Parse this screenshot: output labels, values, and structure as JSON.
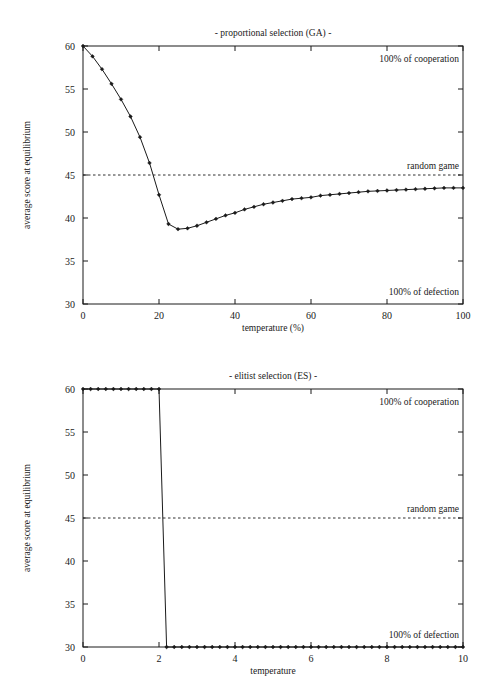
{
  "chart_data": [
    {
      "id": "proportional-selection-ga",
      "type": "line",
      "title": "- proportional selection (GA) -",
      "xlabel": "temperature (%)",
      "ylabel": "average score at equilibrium",
      "xlim": [
        0,
        100
      ],
      "ylim": [
        30,
        60
      ],
      "xticks": [
        0,
        20,
        40,
        60,
        80,
        100
      ],
      "xticklabels": [
        "0",
        "20",
        "40",
        "60",
        "80",
        "100"
      ],
      "yticks": [
        30,
        35,
        40,
        45,
        50,
        55,
        60
      ],
      "yticklabels": [
        "30",
        "35",
        "40",
        "45",
        "50",
        "55",
        "60"
      ],
      "grid": false,
      "legend": "none",
      "annotations": [
        {
          "text": "100% of cooperation",
          "x": 100,
          "y": 58.6,
          "align": "right"
        },
        {
          "text": "random game",
          "x": 100,
          "y": 46.1,
          "align": "right"
        },
        {
          "text": "100% of defection",
          "x": 100,
          "y": 31.4,
          "align": "right"
        }
      ],
      "reference_lines": [
        {
          "name": "random game",
          "axis": "y",
          "value": 45,
          "style": "dashed"
        }
      ],
      "x": [
        0,
        2.5,
        5,
        7.5,
        10,
        12.5,
        15,
        17.5,
        20,
        22.5,
        25,
        27.5,
        30,
        32.5,
        35,
        37.5,
        40,
        42.5,
        45,
        47.5,
        50,
        52.5,
        55,
        57.5,
        60,
        62.5,
        65,
        67.5,
        70,
        72.5,
        75,
        77.5,
        80,
        82.5,
        85,
        87.5,
        90,
        92.5,
        95,
        97.5,
        100
      ],
      "values": [
        60.0,
        58.8,
        57.3,
        55.6,
        53.8,
        51.8,
        49.4,
        46.4,
        42.7,
        39.3,
        38.7,
        38.8,
        39.1,
        39.5,
        39.9,
        40.3,
        40.6,
        41.0,
        41.3,
        41.6,
        41.8,
        42.0,
        42.2,
        42.3,
        42.4,
        42.6,
        42.7,
        42.8,
        42.9,
        43.0,
        43.1,
        43.15,
        43.2,
        43.25,
        43.3,
        43.35,
        43.4,
        43.45,
        43.5,
        43.5,
        43.5
      ]
    },
    {
      "id": "elitist-selection-es",
      "type": "line",
      "title": "- elitist selection (ES) -",
      "xlabel": "temperature",
      "ylabel": "average score at equilibrium",
      "xlim": [
        0,
        10
      ],
      "ylim": [
        30,
        60
      ],
      "xticks": [
        0,
        2,
        4,
        6,
        8,
        10
      ],
      "xticklabels": [
        "0",
        "2",
        "4",
        "6",
        "8",
        "10"
      ],
      "yticks": [
        30,
        35,
        40,
        45,
        50,
        55,
        60
      ],
      "yticklabels": [
        "30",
        "35",
        "40",
        "45",
        "50",
        "55",
        "60"
      ],
      "grid": false,
      "legend": "none",
      "annotations": [
        {
          "text": "100% of cooperation",
          "x": 10,
          "y": 58.6,
          "align": "right"
        },
        {
          "text": "random game",
          "x": 10,
          "y": 46.1,
          "align": "right"
        },
        {
          "text": "100% of defection",
          "x": 10,
          "y": 31.4,
          "align": "right"
        }
      ],
      "reference_lines": [
        {
          "name": "random game",
          "axis": "y",
          "value": 45,
          "style": "dashed"
        }
      ],
      "x": [
        0,
        0.2,
        0.4,
        0.6,
        0.8,
        1.0,
        1.2,
        1.4,
        1.6,
        1.8,
        2.0,
        2.2,
        2.4,
        2.6,
        2.8,
        3.0,
        3.2,
        3.4,
        3.6,
        3.8,
        4.0,
        4.2,
        4.4,
        4.6,
        4.8,
        5.0,
        5.2,
        5.4,
        5.6,
        5.8,
        6.0,
        6.2,
        6.4,
        6.6,
        6.8,
        7.0,
        7.2,
        7.4,
        7.6,
        7.8,
        8.0,
        8.2,
        8.4,
        8.6,
        8.8,
        9.0,
        9.2,
        9.4,
        9.6,
        9.8,
        10.0
      ],
      "values": [
        60,
        60,
        60,
        60,
        60,
        60,
        60,
        60,
        60,
        60,
        60,
        30,
        30,
        30,
        30,
        30,
        30,
        30,
        30,
        30,
        30,
        30,
        30,
        30,
        30,
        30,
        30,
        30,
        30,
        30,
        30,
        30,
        30,
        30,
        30,
        30,
        30,
        30,
        30,
        30,
        30,
        30,
        30,
        30,
        30,
        30,
        30,
        30,
        30,
        30,
        30
      ]
    }
  ],
  "colors": {
    "ink": "#1a1a1a",
    "background": "#ffffff"
  }
}
